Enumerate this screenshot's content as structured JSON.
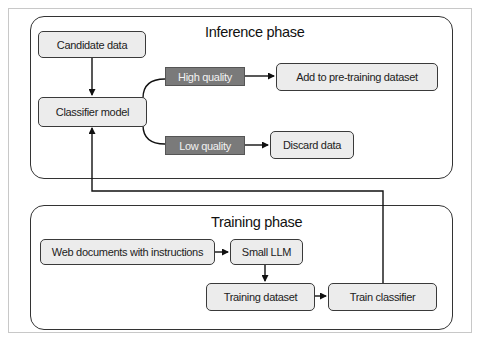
{
  "diagram": {
    "panels": {
      "inference": {
        "title": "Inference phase"
      },
      "training": {
        "title": "Training phase"
      }
    },
    "nodes": {
      "candidate_data": "Candidate data",
      "classifier_model": "Classifier model",
      "high_quality": "High quality",
      "low_quality": "Low quality",
      "add_to_pretraining": "Add to pre-training dataset",
      "discard_data": "Discard data",
      "web_documents": "Web documents with instructions",
      "small_llm": "Small LLM",
      "training_dataset": "Training dataset",
      "train_classifier": "Train classifier"
    },
    "edges": [
      {
        "from": "Candidate data",
        "to": "Classifier model"
      },
      {
        "from": "Classifier model",
        "to": "High quality"
      },
      {
        "from": "High quality",
        "to": "Add to pre-training dataset"
      },
      {
        "from": "Classifier model",
        "to": "Low quality"
      },
      {
        "from": "Low quality",
        "to": "Discard data"
      },
      {
        "from": "Web documents with instructions",
        "to": "Small LLM"
      },
      {
        "from": "Small LLM",
        "to": "Training dataset"
      },
      {
        "from": "Training dataset",
        "to": "Train classifier"
      },
      {
        "from": "Train classifier",
        "to": "Classifier model"
      }
    ],
    "colors": {
      "node_fill": "#ececec",
      "tag_fill": "#7a7a7a",
      "stroke": "#222222"
    }
  }
}
